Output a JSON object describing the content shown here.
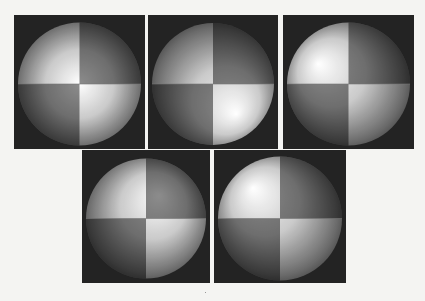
{
  "figure": {
    "background_color": "#f4f4f2",
    "panel_background": "#232323",
    "panels": [
      {
        "id": "p1",
        "light": "front",
        "light_dir": [
          0.0,
          0.0
        ],
        "quadrants": [
          "light",
          "dark",
          "dark",
          "light"
        ]
      },
      {
        "id": "p2",
        "light": "lower-right",
        "light_dir": [
          0.35,
          0.45
        ],
        "quadrants": [
          "light",
          "dark",
          "dark",
          "light"
        ]
      },
      {
        "id": "p3",
        "light": "upper-left",
        "light_dir": [
          -0.45,
          -0.3
        ],
        "quadrants": [
          "light",
          "dark",
          "dark",
          "light"
        ]
      },
      {
        "id": "p4",
        "light": "upper-right",
        "light_dir": [
          0.2,
          -0.35
        ],
        "quadrants": [
          "light",
          "dark",
          "dark",
          "light"
        ]
      },
      {
        "id": "p5",
        "light": "upper-left",
        "light_dir": [
          -0.4,
          -0.45
        ],
        "quadrants": [
          "light",
          "dark",
          "dark",
          "light"
        ]
      }
    ]
  }
}
